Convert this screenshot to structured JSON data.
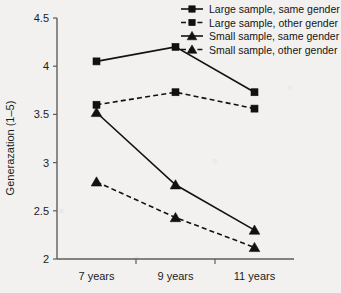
{
  "chart_data": {
    "type": "line",
    "title": "",
    "xlabel": "",
    "ylabel": "Generazation (1–5)",
    "categories": [
      "7 years",
      "9 years",
      "11 years"
    ],
    "ylim": [
      2,
      4.5
    ],
    "yticks": [
      "2",
      "2.5",
      "3",
      "3.5",
      "4",
      "4.5"
    ],
    "ytick_values": [
      2,
      2.5,
      3,
      3.5,
      4,
      4.5
    ],
    "grid": false,
    "legend_position": "top-right",
    "series": [
      {
        "name": "Large sample, same gender",
        "marker": "square",
        "line": "solid",
        "color": "#111111",
        "values": [
          4.05,
          4.2,
          3.73
        ]
      },
      {
        "name": "Large sample, other gender",
        "marker": "square",
        "line": "dashed",
        "color": "#111111",
        "values": [
          3.6,
          3.73,
          3.56
        ]
      },
      {
        "name": "Small sample, same gender",
        "marker": "triangle",
        "line": "solid",
        "color": "#111111",
        "values": [
          3.52,
          2.77,
          2.3
        ]
      },
      {
        "name": "Small sample, other gender",
        "marker": "triangle",
        "line": "dashed",
        "color": "#111111",
        "values": [
          2.8,
          2.43,
          2.12
        ]
      }
    ]
  }
}
